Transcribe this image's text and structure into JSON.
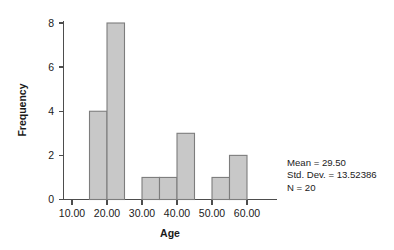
{
  "chart_data": {
    "type": "bar",
    "title": "",
    "subtitle": "",
    "xlabel": "Age",
    "ylabel": "Frequency",
    "xlim": [
      5,
      62.5
    ],
    "ylim": [
      0,
      8.6
    ],
    "grid": false,
    "legend": "none",
    "bin_width": 5,
    "x_tick_labels": [
      "10.00",
      "20.00",
      "30.00",
      "40.00",
      "50.00",
      "60.00"
    ],
    "x_tick_values": [
      10,
      20,
      30,
      40,
      50,
      60
    ],
    "y_tick_labels": [
      "0",
      "2",
      "4",
      "6",
      "8"
    ],
    "y_tick_values": [
      0,
      2,
      4,
      6,
      8
    ],
    "bins": [
      {
        "start": 15,
        "end": 20,
        "value": 4
      },
      {
        "start": 20,
        "end": 25,
        "value": 8
      },
      {
        "start": 30,
        "end": 35,
        "value": 1
      },
      {
        "start": 35,
        "end": 40,
        "value": 1
      },
      {
        "start": 40,
        "end": 45,
        "value": 3
      },
      {
        "start": 50,
        "end": 55,
        "value": 1
      },
      {
        "start": 55,
        "end": 60,
        "value": 2
      }
    ],
    "categories": [
      "15-20",
      "20-25",
      "30-35",
      "35-40",
      "40-45",
      "50-55",
      "55-60"
    ],
    "values": [
      4,
      8,
      1,
      1,
      3,
      1,
      2
    ],
    "bar_fill_color": "#c8c8c8",
    "bar_stroke_color": "#7d7d7d",
    "axis_color": "#4d4d4d"
  },
  "annotations": {
    "mean": "Mean = 29.50",
    "std_dev": "Std. Dev. = 13.52386",
    "n": "N = 20"
  }
}
